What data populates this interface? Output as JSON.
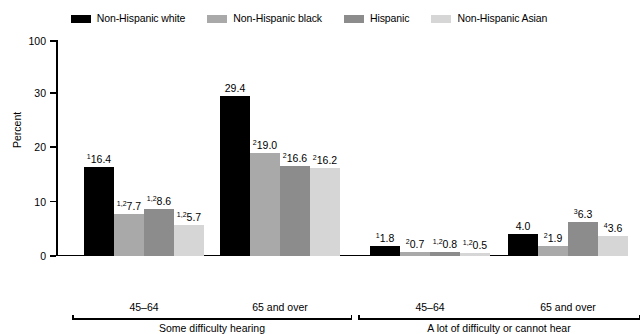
{
  "chart_data": {
    "type": "bar",
    "title": "",
    "xlabel": "",
    "ylabel": "Percent",
    "ylim": [
      0,
      100
    ],
    "y_ticks": [
      0,
      10,
      20,
      30,
      100
    ],
    "y_tick_labels": [
      "0",
      "10",
      "20",
      "30",
      "100"
    ],
    "axis_note": "broken y-axis: 0-30 linear, then jump to 100 at top",
    "grid": false,
    "legend_position": "top-center",
    "categories": [
      "Some difficulty hearing / 45–64",
      "Some difficulty hearing / 65 and over",
      "A lot of difficulty or cannot hear / 45–64",
      "A lot of difficulty or cannot hear / 65 and over"
    ],
    "series": [
      {
        "name": "Non-Hispanic white",
        "color": "#000000",
        "values": [
          16.4,
          29.4,
          1.8,
          4.0
        ]
      },
      {
        "name": "Non-Hispanic black",
        "color": "#a9a9a9",
        "values": [
          7.7,
          19.0,
          0.7,
          1.9
        ]
      },
      {
        "name": "Hispanic",
        "color": "#8c8c8c",
        "values": [
          8.6,
          16.6,
          0.8,
          6.3
        ]
      },
      {
        "name": "Non-Hispanic Asian",
        "color": "#d6d6d6",
        "values": [
          5.7,
          16.2,
          0.5,
          3.6
        ]
      }
    ]
  },
  "legend": {
    "items": [
      {
        "label": "Non-Hispanic white",
        "color": "#000000"
      },
      {
        "label": "Non-Hispanic black",
        "color": "#a9a9a9"
      },
      {
        "label": "Hispanic",
        "color": "#8c8c8c"
      },
      {
        "label": "Non-Hispanic Asian",
        "color": "#d6d6d6"
      }
    ]
  },
  "y_axis": {
    "title": "Percent",
    "ticks": [
      {
        "label": "100"
      },
      {
        "label": "30"
      },
      {
        "label": "20"
      },
      {
        "label": "10"
      },
      {
        "label": "0"
      }
    ]
  },
  "x_axis": {
    "groups": [
      {
        "label": "Some difficulty hearing",
        "ages": [
          "45–64",
          "65 and over"
        ]
      },
      {
        "label": "A lot of difficulty or cannot hear",
        "ages": [
          "45–64",
          "65 and over"
        ]
      }
    ]
  },
  "bars": [
    {
      "series": "Non-Hispanic white",
      "value": "16.4",
      "sup": "1",
      "group": 0
    },
    {
      "series": "Non-Hispanic black",
      "value": "7.7",
      "sup": "1,2",
      "group": 0
    },
    {
      "series": "Hispanic",
      "value": "8.6",
      "sup": "1,2",
      "group": 0
    },
    {
      "series": "Non-Hispanic Asian",
      "value": "5.7",
      "sup": "1,2",
      "group": 0
    },
    {
      "series": "Non-Hispanic white",
      "value": "29.4",
      "sup": "",
      "group": 1
    },
    {
      "series": "Non-Hispanic black",
      "value": "19.0",
      "sup": "2",
      "group": 1
    },
    {
      "series": "Hispanic",
      "value": "16.6",
      "sup": "2",
      "group": 1
    },
    {
      "series": "Non-Hispanic Asian",
      "value": "16.2",
      "sup": "2",
      "group": 1
    },
    {
      "series": "Non-Hispanic white",
      "value": "1.8",
      "sup": "1",
      "group": 2
    },
    {
      "series": "Non-Hispanic black",
      "value": "0.7",
      "sup": "2",
      "group": 2
    },
    {
      "series": "Hispanic",
      "value": "0.8",
      "sup": "1,2",
      "group": 2
    },
    {
      "series": "Non-Hispanic Asian",
      "value": "0.5",
      "sup": "1,2",
      "group": 2
    },
    {
      "series": "Non-Hispanic white",
      "value": "4.0",
      "sup": "",
      "group": 3
    },
    {
      "series": "Non-Hispanic black",
      "value": "1.9",
      "sup": "2",
      "group": 3
    },
    {
      "series": "Hispanic",
      "value": "6.3",
      "sup": "3",
      "group": 3
    },
    {
      "series": "Non-Hispanic Asian",
      "value": "3.6",
      "sup": "4",
      "group": 3
    }
  ]
}
